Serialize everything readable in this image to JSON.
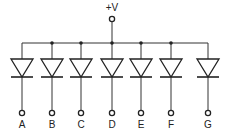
{
  "supply": {
    "label": "+V",
    "x": 112,
    "label_y": 11,
    "terminal_y": 19
  },
  "bus": {
    "y": 43,
    "x_start": 22,
    "x_end": 208
  },
  "diode_geometry": {
    "half_width": 11,
    "top_y": 59,
    "apex_y": 77,
    "terminal_y": 113,
    "label_y": 128
  },
  "diodes": [
    {
      "label": "A",
      "x": 22,
      "junction": false
    },
    {
      "label": "B",
      "x": 52,
      "junction": true
    },
    {
      "label": "C",
      "x": 81,
      "junction": true
    },
    {
      "label": "D",
      "x": 112,
      "junction": true
    },
    {
      "label": "E",
      "x": 141,
      "junction": true
    },
    {
      "label": "F",
      "x": 171,
      "junction": true
    },
    {
      "label": "G",
      "x": 208,
      "junction": false
    }
  ],
  "colors": {
    "stroke": "#222222",
    "background": "#ffffff"
  }
}
